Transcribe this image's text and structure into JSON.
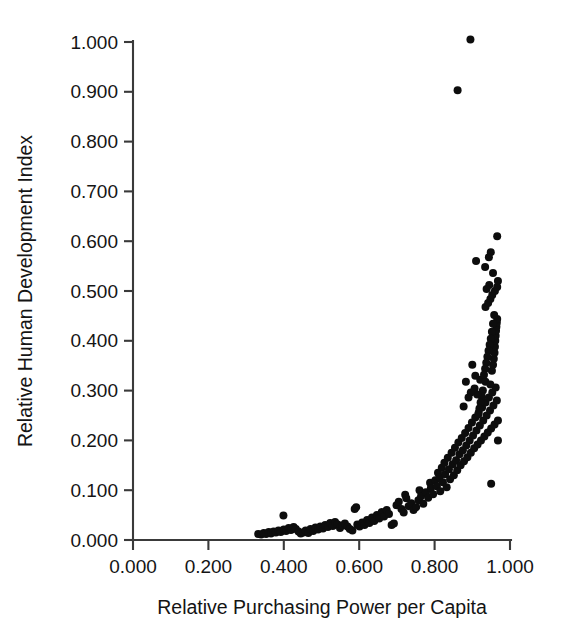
{
  "figure": {
    "name": "relative-hdi-vs-purchasing-power-scatter",
    "background": "#ffffff",
    "point_color": "#0d0d0d",
    "axis_color": "#3a3a3a"
  },
  "chart_data": {
    "type": "scatter",
    "title": "",
    "xlabel": "Relative Purchasing Power per Capita",
    "ylabel": "Relative Human Development Index",
    "xlim": [
      0.0,
      1.0
    ],
    "ylim": [
      0.0,
      1.0
    ],
    "grid": false,
    "legend": null,
    "xticks": [
      0.0,
      0.2,
      0.4,
      0.6,
      0.8,
      1.0
    ],
    "yticks": [
      0.0,
      0.1,
      0.2,
      0.3,
      0.4,
      0.5,
      0.6,
      0.7,
      0.8,
      0.9,
      1.0
    ],
    "xtick_labels": [
      "0.000",
      "0.200",
      "0.400",
      "0.600",
      "0.800",
      "1.000"
    ],
    "ytick_labels": [
      "0.000",
      "0.100",
      "0.200",
      "0.300",
      "0.400",
      "0.500",
      "0.600",
      "0.700",
      "0.800",
      "0.900",
      "1.000"
    ],
    "marker": "circle",
    "marker_size": 8,
    "n_points": 182,
    "points": [
      [
        0.332,
        0.012
      ],
      [
        0.34,
        0.011
      ],
      [
        0.347,
        0.014
      ],
      [
        0.353,
        0.012
      ],
      [
        0.36,
        0.016
      ],
      [
        0.366,
        0.013
      ],
      [
        0.373,
        0.017
      ],
      [
        0.379,
        0.015
      ],
      [
        0.386,
        0.019
      ],
      [
        0.392,
        0.016
      ],
      [
        0.399,
        0.049
      ],
      [
        0.4,
        0.021
      ],
      [
        0.406,
        0.018
      ],
      [
        0.413,
        0.024
      ],
      [
        0.419,
        0.02
      ],
      [
        0.426,
        0.026
      ],
      [
        0.432,
        0.022
      ],
      [
        0.439,
        0.017
      ],
      [
        0.445,
        0.013
      ],
      [
        0.452,
        0.015
      ],
      [
        0.458,
        0.019
      ],
      [
        0.465,
        0.014
      ],
      [
        0.471,
        0.022
      ],
      [
        0.478,
        0.018
      ],
      [
        0.484,
        0.025
      ],
      [
        0.491,
        0.021
      ],
      [
        0.497,
        0.027
      ],
      [
        0.504,
        0.023
      ],
      [
        0.51,
        0.03
      ],
      [
        0.517,
        0.026
      ],
      [
        0.523,
        0.034
      ],
      [
        0.53,
        0.028
      ],
      [
        0.536,
        0.036
      ],
      [
        0.543,
        0.031
      ],
      [
        0.549,
        0.024
      ],
      [
        0.556,
        0.029
      ],
      [
        0.562,
        0.033
      ],
      [
        0.569,
        0.027
      ],
      [
        0.575,
        0.022
      ],
      [
        0.582,
        0.019
      ],
      [
        0.588,
        0.062
      ],
      [
        0.592,
        0.066
      ],
      [
        0.595,
        0.031
      ],
      [
        0.601,
        0.027
      ],
      [
        0.608,
        0.035
      ],
      [
        0.614,
        0.03
      ],
      [
        0.621,
        0.04
      ],
      [
        0.627,
        0.034
      ],
      [
        0.634,
        0.045
      ],
      [
        0.64,
        0.038
      ],
      [
        0.647,
        0.05
      ],
      [
        0.653,
        0.043
      ],
      [
        0.66,
        0.056
      ],
      [
        0.666,
        0.047
      ],
      [
        0.673,
        0.06
      ],
      [
        0.679,
        0.052
      ],
      [
        0.686,
        0.03
      ],
      [
        0.692,
        0.033
      ],
      [
        0.699,
        0.07
      ],
      [
        0.705,
        0.077
      ],
      [
        0.712,
        0.062
      ],
      [
        0.718,
        0.055
      ],
      [
        0.722,
        0.091
      ],
      [
        0.725,
        0.084
      ],
      [
        0.731,
        0.068
      ],
      [
        0.738,
        0.074
      ],
      [
        0.744,
        0.06
      ],
      [
        0.751,
        0.066
      ],
      [
        0.757,
        0.08
      ],
      [
        0.76,
        0.1
      ],
      [
        0.764,
        0.088
      ],
      [
        0.77,
        0.073
      ],
      [
        0.777,
        0.096
      ],
      [
        0.783,
        0.085
      ],
      [
        0.788,
        0.115
      ],
      [
        0.79,
        0.104
      ],
      [
        0.796,
        0.092
      ],
      [
        0.802,
        0.12
      ],
      [
        0.806,
        0.108
      ],
      [
        0.809,
        0.135
      ],
      [
        0.813,
        0.126
      ],
      [
        0.815,
        0.098
      ],
      [
        0.819,
        0.145
      ],
      [
        0.822,
        0.116
      ],
      [
        0.826,
        0.155
      ],
      [
        0.828,
        0.132
      ],
      [
        0.832,
        0.106
      ],
      [
        0.835,
        0.165
      ],
      [
        0.838,
        0.142
      ],
      [
        0.841,
        0.122
      ],
      [
        0.845,
        0.175
      ],
      [
        0.848,
        0.152
      ],
      [
        0.851,
        0.13
      ],
      [
        0.854,
        0.185
      ],
      [
        0.857,
        0.16
      ],
      [
        0.86,
        0.14
      ],
      [
        0.863,
        0.196
      ],
      [
        0.866,
        0.172
      ],
      [
        0.869,
        0.15
      ],
      [
        0.872,
        0.205
      ],
      [
        0.875,
        0.18
      ],
      [
        0.878,
        0.158
      ],
      [
        0.881,
        0.215
      ],
      [
        0.884,
        0.19
      ],
      [
        0.887,
        0.166
      ],
      [
        0.89,
        0.225
      ],
      [
        0.893,
        0.2
      ],
      [
        0.896,
        0.175
      ],
      [
        0.899,
        0.236
      ],
      [
        0.902,
        0.21
      ],
      [
        0.905,
        0.184
      ],
      [
        0.908,
        0.246
      ],
      [
        0.911,
        0.22
      ],
      [
        0.914,
        0.192
      ],
      [
        0.917,
        0.256
      ],
      [
        0.92,
        0.23
      ],
      [
        0.923,
        0.2
      ],
      [
        0.926,
        0.266
      ],
      [
        0.929,
        0.24
      ],
      [
        0.932,
        0.208
      ],
      [
        0.935,
        0.276
      ],
      [
        0.938,
        0.25
      ],
      [
        0.941,
        0.216
      ],
      [
        0.944,
        0.286
      ],
      [
        0.947,
        0.26
      ],
      [
        0.95,
        0.224
      ],
      [
        0.953,
        0.296
      ],
      [
        0.956,
        0.27
      ],
      [
        0.959,
        0.232
      ],
      [
        0.962,
        0.306
      ],
      [
        0.965,
        0.28
      ],
      [
        0.968,
        0.24
      ],
      [
        0.908,
        0.33
      ],
      [
        0.921,
        0.322
      ],
      [
        0.935,
        0.318
      ],
      [
        0.948,
        0.312
      ],
      [
        0.952,
        0.34
      ],
      [
        0.955,
        0.352
      ],
      [
        0.957,
        0.364
      ],
      [
        0.959,
        0.376
      ],
      [
        0.96,
        0.388
      ],
      [
        0.961,
        0.4
      ],
      [
        0.962,
        0.41
      ],
      [
        0.963,
        0.42
      ],
      [
        0.964,
        0.428
      ],
      [
        0.965,
        0.436
      ],
      [
        0.966,
        0.444
      ],
      [
        0.958,
        0.452
      ],
      [
        0.955,
        0.434
      ],
      [
        0.952,
        0.418
      ],
      [
        0.949,
        0.404
      ],
      [
        0.946,
        0.392
      ],
      [
        0.943,
        0.38
      ],
      [
        0.94,
        0.368
      ],
      [
        0.937,
        0.356
      ],
      [
        0.934,
        0.344
      ],
      [
        0.931,
        0.332
      ],
      [
        0.928,
        0.3
      ],
      [
        0.925,
        0.288
      ],
      [
        0.922,
        0.276
      ],
      [
        0.919,
        0.264
      ],
      [
        0.916,
        0.252
      ],
      [
        0.913,
        0.292
      ],
      [
        0.906,
        0.304
      ],
      [
        0.9,
        0.352
      ],
      [
        0.896,
        0.296
      ],
      [
        0.89,
        0.286
      ],
      [
        0.883,
        0.318
      ],
      [
        0.877,
        0.268
      ],
      [
        0.935,
        0.468
      ],
      [
        0.942,
        0.476
      ],
      [
        0.948,
        0.484
      ],
      [
        0.953,
        0.492
      ],
      [
        0.96,
        0.5
      ],
      [
        0.966,
        0.508
      ],
      [
        0.968,
        0.52
      ],
      [
        0.945,
        0.512
      ],
      [
        0.938,
        0.504
      ],
      [
        0.966,
        0.61
      ],
      [
        0.949,
        0.578
      ],
      [
        0.91,
        0.56
      ],
      [
        0.934,
        0.548
      ],
      [
        0.955,
        0.536
      ],
      [
        0.944,
        0.568
      ],
      [
        0.968,
        0.2
      ],
      [
        0.95,
        0.113
      ],
      [
        0.895,
        1.005
      ],
      [
        0.861,
        0.903
      ]
    ]
  },
  "axis_geometry": {
    "x0_px": 133,
    "x1_px": 510,
    "y0_px": 540,
    "y1_px": 42
  }
}
